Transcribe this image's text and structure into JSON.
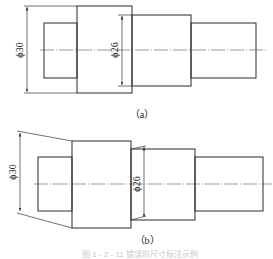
{
  "figure_a": {
    "caption": "（a）",
    "dim_outer": "ϕ30",
    "dim_inner": "ϕ26"
  },
  "figure_b": {
    "caption": "（b）",
    "dim_outer": "ϕ30",
    "dim_inner": "ϕ26"
  },
  "footer": {
    "text": "图 1 - 2 - 11   错误的尺寸标注示例"
  },
  "colors": {
    "line": "#2b2b2b",
    "background": "#ffffff"
  }
}
